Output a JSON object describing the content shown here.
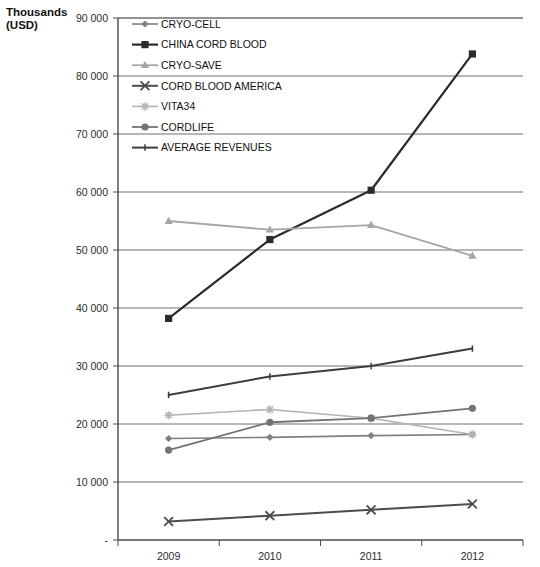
{
  "axis_title": "Thousands\n(USD)",
  "chart_data": {
    "type": "line",
    "title": "",
    "xlabel": "",
    "ylabel": "Thousands (USD)",
    "categories": [
      "2009",
      "2010",
      "2011",
      "2012"
    ],
    "x": [
      2009,
      2010,
      2011,
      2012
    ],
    "ylim": [
      0,
      90000
    ],
    "yticks": [
      0,
      10000,
      20000,
      30000,
      40000,
      50000,
      60000,
      70000,
      80000,
      90000
    ],
    "ytick_labels": [
      "-",
      "10 000",
      "20 000",
      "30 000",
      "40 000",
      "50 000",
      "60 000",
      "70 000",
      "80 000",
      "90 000"
    ],
    "grid": true,
    "legend_position": "top-left-inside",
    "series": [
      {
        "name": "CRYO-CELL",
        "marker": "diamond",
        "color": "#808080",
        "line_width": 1.6,
        "values": [
          17500,
          17700,
          18000,
          18200
        ]
      },
      {
        "name": "CHINA CORD BLOOD",
        "marker": "square",
        "color": "#2b2b2b",
        "line_width": 2.2,
        "values": [
          38200,
          51800,
          60300,
          83800
        ]
      },
      {
        "name": "CRYO-SAVE",
        "marker": "triangle",
        "color": "#a6a6a6",
        "line_width": 1.8,
        "values": [
          55000,
          53500,
          54300,
          49000
        ]
      },
      {
        "name": "CORD BLOOD AMERICA",
        "marker": "x",
        "color": "#4d4d4d",
        "line_width": 2.0,
        "values": [
          3200,
          4200,
          5200,
          6200
        ]
      },
      {
        "name": "VITA34",
        "marker": "star",
        "color": "#b3b3b3",
        "line_width": 1.6,
        "values": [
          21500,
          22500,
          21000,
          18200
        ]
      },
      {
        "name": "CORDLIFE",
        "marker": "circle",
        "color": "#737373",
        "line_width": 1.8,
        "values": [
          15500,
          20300,
          21000,
          22700
        ]
      },
      {
        "name": "AVERAGE REVENUES",
        "marker": "tick",
        "color": "#3d3d3d",
        "line_width": 2.0,
        "values": [
          25000,
          28200,
          30000,
          33000
        ]
      }
    ]
  }
}
